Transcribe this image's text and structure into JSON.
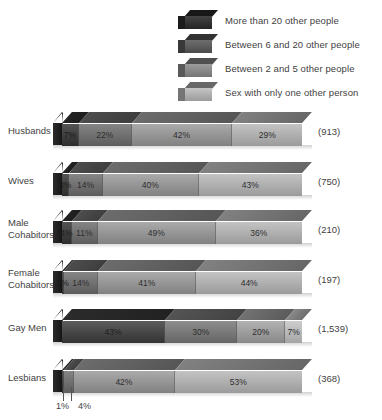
{
  "legend": {
    "items": [
      {
        "label": "More than 20 other people",
        "shade": "#2b2b2b"
      },
      {
        "label": "Between 6 and 20 other people",
        "shade": "#5a5a5a"
      },
      {
        "label": "Between 2 and 5 other people",
        "shade": "#8f8f8f"
      },
      {
        "label": "Sex with only one other person",
        "shade": "#bdbdbd"
      }
    ]
  },
  "chart_data": {
    "type": "bar",
    "orientation": "horizontal",
    "stacked": "100%",
    "title": "",
    "xlabel": "",
    "ylabel": "",
    "xlim": [
      0,
      100
    ],
    "grid": false,
    "legend_position": "top",
    "categories": [
      "Husbands",
      "Wives",
      "Male Cohabitors",
      "Female Cohabitors",
      "Gay Men",
      "Lesbians"
    ],
    "series": [
      {
        "name": "More than 20 other people",
        "values": [
          7,
          3,
          4,
          1,
          43,
          1
        ]
      },
      {
        "name": "Between 6 and 20 other people",
        "values": [
          22,
          14,
          11,
          14,
          30,
          4
        ]
      },
      {
        "name": "Between 2 and 5 other people",
        "values": [
          42,
          40,
          49,
          41,
          20,
          42
        ]
      },
      {
        "name": "Sex with only one other person",
        "values": [
          29,
          43,
          36,
          44,
          7,
          53
        ]
      }
    ],
    "counts": [
      "(913)",
      "(750)",
      "(210)",
      "(197)",
      "(1,539)",
      "(368)"
    ]
  },
  "rows": [
    {
      "label_line1": "Husbands",
      "label_line2": "",
      "count": "(913)",
      "segments": [
        {
          "value": 7,
          "label": "7%",
          "shade": "#343434",
          "show": true,
          "dark": true
        },
        {
          "value": 22,
          "label": "22%",
          "shade": "#6e6e6e",
          "show": true,
          "dark": false
        },
        {
          "value": 42,
          "label": "42%",
          "shade": "#9a9a9a",
          "show": true,
          "dark": false
        },
        {
          "value": 29,
          "label": "29%",
          "shade": "#b8b8b8",
          "show": true,
          "dark": false
        }
      ]
    },
    {
      "label_line1": "Wives",
      "label_line2": "",
      "count": "(750)",
      "segments": [
        {
          "value": 3,
          "label": "3%",
          "shade": "#343434",
          "show": true,
          "dark": true
        },
        {
          "value": 14,
          "label": "14%",
          "shade": "#6e6e6e",
          "show": true,
          "dark": false
        },
        {
          "value": 40,
          "label": "40%",
          "shade": "#9a9a9a",
          "show": true,
          "dark": false
        },
        {
          "value": 43,
          "label": "43%",
          "shade": "#b8b8b8",
          "show": true,
          "dark": false
        }
      ]
    },
    {
      "label_line1": "Male",
      "label_line2": "Cohabitors",
      "count": "(210)",
      "segments": [
        {
          "value": 4,
          "label": "4%",
          "shade": "#343434",
          "show": true,
          "dark": true
        },
        {
          "value": 11,
          "label": "11%",
          "shade": "#6e6e6e",
          "show": true,
          "dark": false
        },
        {
          "value": 49,
          "label": "49%",
          "shade": "#9a9a9a",
          "show": true,
          "dark": false
        },
        {
          "value": 36,
          "label": "36%",
          "shade": "#b8b8b8",
          "show": true,
          "dark": false
        }
      ]
    },
    {
      "label_line1": "Female",
      "label_line2": "Cohabitors",
      "count": "(197)",
      "segments": [
        {
          "value": 1,
          "label": "1%",
          "shade": "#343434",
          "show": true,
          "dark": true
        },
        {
          "value": 14,
          "label": "14%",
          "shade": "#6e6e6e",
          "show": true,
          "dark": false
        },
        {
          "value": 41,
          "label": "41%",
          "shade": "#9a9a9a",
          "show": true,
          "dark": false
        },
        {
          "value": 44,
          "label": "44%",
          "shade": "#b8b8b8",
          "show": true,
          "dark": false
        }
      ]
    },
    {
      "label_line1": "Gay Men",
      "label_line2": "",
      "count": "(1,539)",
      "segments": [
        {
          "value": 43,
          "label": "43%",
          "shade": "#3d3d3d",
          "show": true,
          "dark": true
        },
        {
          "value": 30,
          "label": "30%",
          "shade": "#787878",
          "show": true,
          "dark": false
        },
        {
          "value": 20,
          "label": "20%",
          "shade": "#a3a3a3",
          "show": true,
          "dark": false
        },
        {
          "value": 7,
          "label": "7%",
          "shade": "#c4c4c4",
          "show": true,
          "dark": false
        }
      ]
    },
    {
      "label_line1": "Lesbians",
      "label_line2": "",
      "count": "(368)",
      "callouts": [
        {
          "label": "1%"
        },
        {
          "label": "4%"
        }
      ],
      "segments": [
        {
          "value": 1,
          "label": "1%",
          "shade": "#343434",
          "show": false,
          "dark": true
        },
        {
          "value": 4,
          "label": "4%",
          "shade": "#6e6e6e",
          "show": false,
          "dark": false
        },
        {
          "value": 42,
          "label": "42%",
          "shade": "#9a9a9a",
          "show": true,
          "dark": false
        },
        {
          "value": 53,
          "label": "53%",
          "shade": "#b8b8b8",
          "show": true,
          "dark": false
        }
      ]
    }
  ]
}
